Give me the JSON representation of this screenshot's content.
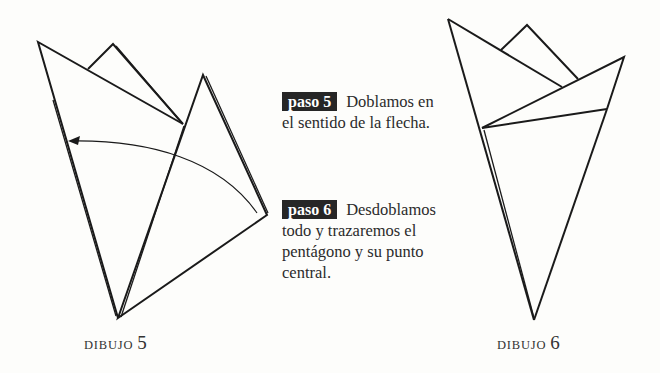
{
  "steps": [
    {
      "badge": "paso 5",
      "text_line1": "Doblamos en",
      "text_rest": [
        "el sentido de la flecha."
      ]
    },
    {
      "badge": "paso 6",
      "text_line1": "Desdoblamos",
      "text_rest": [
        "todo y trazaremos el",
        "pentágono y su punto",
        "central."
      ]
    }
  ],
  "figures": [
    {
      "caption_word": "DIBUJO",
      "caption_num": "5"
    },
    {
      "caption_word": "DIBUJO",
      "caption_num": "6"
    }
  ],
  "colors": {
    "badge_bg": "#262626",
    "line": "#1a1a1a",
    "background": "#fdfdfb"
  }
}
